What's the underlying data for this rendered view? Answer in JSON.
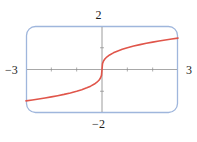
{
  "figure": {
    "kind": "graphing-calculator-plot",
    "background_color": "#ffffff",
    "frame_color": "#9fb6dc",
    "frame_corner_radius": 9
  },
  "labels": {
    "y_max": "2",
    "y_min": "−2",
    "x_min": "−3",
    "x_max": "3"
  },
  "chart_data": {
    "type": "line",
    "title": "",
    "xlabel": "",
    "ylabel": "",
    "xlim": [
      -3,
      3
    ],
    "ylim": [
      -2,
      2
    ],
    "grid": false,
    "legend": "none",
    "axis_color": "#8c8c8c",
    "tick_marks": {
      "x": [
        -2,
        -1,
        1,
        2
      ],
      "y": [
        -1,
        1
      ]
    },
    "tick_labels": {
      "x": [
        "−3",
        "3"
      ],
      "y": [
        "−2",
        "2"
      ]
    },
    "series": [
      {
        "name": "cube root",
        "color": "#e0554a",
        "width": 1.6,
        "x": [
          -3.0,
          -2.75,
          -2.5,
          -2.25,
          -2.0,
          -1.75,
          -1.5,
          -1.25,
          -1.0,
          -0.8,
          -0.6,
          -0.45,
          -0.3,
          -0.2,
          -0.12,
          -0.06,
          -0.02,
          0.0,
          0.02,
          0.06,
          0.12,
          0.2,
          0.3,
          0.45,
          0.6,
          0.8,
          1.0,
          1.25,
          1.5,
          1.75,
          2.0,
          2.25,
          2.5,
          2.75,
          3.0
        ],
        "y": [
          -1.442,
          -1.402,
          -1.357,
          -1.31,
          -1.26,
          -1.205,
          -1.145,
          -1.077,
          -1.0,
          -0.928,
          -0.843,
          -0.766,
          -0.669,
          -0.585,
          -0.493,
          -0.391,
          -0.271,
          0.0,
          0.271,
          0.391,
          0.493,
          0.585,
          0.669,
          0.766,
          0.843,
          0.928,
          1.0,
          1.077,
          1.145,
          1.205,
          1.26,
          1.31,
          1.357,
          1.402,
          1.442
        ]
      }
    ]
  }
}
